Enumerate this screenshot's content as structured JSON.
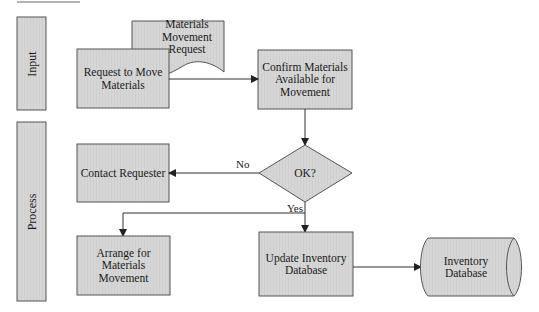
{
  "diagram": {
    "type": "cross-functional flowchart",
    "colors": {
      "shape_fill": "#d4d4d4",
      "shape_stroke": "#555555",
      "connector": "#333333",
      "header_rule": "#999999"
    },
    "lanes": [
      {
        "id": "input",
        "label": "Input"
      },
      {
        "id": "process",
        "label": "Process"
      }
    ],
    "nodes": {
      "request_to_move": {
        "label_line1": "Request to Move",
        "label_line2": "Materials",
        "shape": "process",
        "lane": "input"
      },
      "materials_request_doc": {
        "label_line1": "Materials",
        "label_line2": "Movement Request",
        "shape": "document",
        "lane": "input"
      },
      "confirm_materials": {
        "label_line1": "Confirm Materials",
        "label_line2": "Available for",
        "label_line3": "Movement",
        "shape": "process",
        "lane": "input"
      },
      "ok_decision": {
        "label": "OK?",
        "shape": "decision",
        "lane": "process"
      },
      "contact_requester": {
        "label": "Contact Requester",
        "shape": "process",
        "lane": "process"
      },
      "arrange_movement": {
        "label_line1": "Arrange for",
        "label_line2": "Materials",
        "label_line3": "Movement",
        "shape": "process",
        "lane": "process"
      },
      "update_inventory": {
        "label_line1": "Update Inventory",
        "label_line2": "Database",
        "shape": "process",
        "lane": "process"
      },
      "inventory_database": {
        "label_line1": "Inventory",
        "label_line2": "Database",
        "shape": "database",
        "lane": "process"
      }
    },
    "edges": [
      {
        "from": "request_to_move",
        "to": "confirm_materials",
        "label": ""
      },
      {
        "from": "confirm_materials",
        "to": "ok_decision",
        "label": ""
      },
      {
        "from": "ok_decision",
        "to": "contact_requester",
        "label": "No"
      },
      {
        "from": "ok_decision",
        "to": "update_inventory",
        "label": "Yes"
      },
      {
        "from": "ok_decision",
        "to": "arrange_movement",
        "label": "Yes"
      },
      {
        "from": "update_inventory",
        "to": "inventory_database",
        "label": ""
      }
    ],
    "edge_labels": {
      "no": "No",
      "yes": "Yes"
    }
  }
}
